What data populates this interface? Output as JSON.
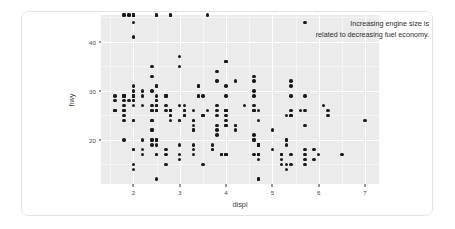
{
  "chart_data": {
    "type": "scatter",
    "title": "",
    "subtitle": "",
    "xlabel": "displ",
    "ylabel": "hwy",
    "xlim": [
      1.3,
      7.3
    ],
    "ylim": [
      11,
      45.5
    ],
    "xticks": [
      2,
      3,
      4,
      5,
      6,
      7
    ],
    "yticks": [
      20,
      30,
      40
    ],
    "grid": true,
    "legend": "none",
    "annotations": [
      {
        "name": "trend-note",
        "lines": [
          "Increasing engine size is",
          "related to decreasing fuel economy."
        ],
        "text": "Increasing engine size is related to decreasing fuel economy.",
        "align": "right",
        "x": 7.3,
        "y": 45
      }
    ],
    "point_color": "#1a1a1a",
    "panel_color": "#ebebeb",
    "grid_color": "#ffffff",
    "n_points": 234,
    "x": [
      1.8,
      1.8,
      2.0,
      2.0,
      2.8,
      2.8,
      3.1,
      1.8,
      1.8,
      2.0,
      2.0,
      2.8,
      2.8,
      3.1,
      3.1,
      2.8,
      3.1,
      4.2,
      5.3,
      5.3,
      5.3,
      5.7,
      6.0,
      5.7,
      5.7,
      6.2,
      6.2,
      7.0,
      5.3,
      5.3,
      5.7,
      6.5,
      2.4,
      2.4,
      3.1,
      3.5,
      3.6,
      2.4,
      3.0,
      3.3,
      3.3,
      3.3,
      3.3,
      3.3,
      3.8,
      3.8,
      3.8,
      4.0,
      3.7,
      3.7,
      3.9,
      3.9,
      4.7,
      4.7,
      4.7,
      5.2,
      5.2,
      3.9,
      4.7,
      4.7,
      4.7,
      5.2,
      5.7,
      5.9,
      4.7,
      4.7,
      4.7,
      4.7,
      4.7,
      4.7,
      5.2,
      5.2,
      5.7,
      5.9,
      4.6,
      5.4,
      5.4,
      4.0,
      4.0,
      4.0,
      4.0,
      4.6,
      5.0,
      4.2,
      4.2,
      4.6,
      4.6,
      4.6,
      5.4,
      5.4,
      3.8,
      3.8,
      4.0,
      4.0,
      4.6,
      4.6,
      4.6,
      4.6,
      5.4,
      1.6,
      1.6,
      1.6,
      1.6,
      1.6,
      1.8,
      1.8,
      1.8,
      2.0,
      2.4,
      2.4,
      2.4,
      2.4,
      2.5,
      2.5,
      3.3,
      2.0,
      2.0,
      2.0,
      2.0,
      2.7,
      2.7,
      2.7,
      3.0,
      3.7,
      4.0,
      4.7,
      4.7,
      4.7,
      5.7,
      6.1,
      4.0,
      4.2,
      4.4,
      4.6,
      5.4,
      5.4,
      5.4,
      4.0,
      4.0,
      4.6,
      5.0,
      2.4,
      2.4,
      2.5,
      2.5,
      3.5,
      3.5,
      3.0,
      3.0,
      3.5,
      3.3,
      3.3,
      4.0,
      5.6,
      3.1,
      3.8,
      3.8,
      3.8,
      5.3,
      2.5,
      2.5,
      2.5,
      2.5,
      2.5,
      2.5,
      2.2,
      2.2,
      2.5,
      2.5,
      2.5,
      2.5,
      2.5,
      2.5,
      2.7,
      2.7,
      3.4,
      3.4,
      4.0,
      4.7,
      2.2,
      2.2,
      2.4,
      2.4,
      3.0,
      3.0,
      3.5,
      2.2,
      2.2,
      2.4,
      2.4,
      3.0,
      3.0,
      3.3,
      1.8,
      1.8,
      1.8,
      1.8,
      1.8,
      4.7,
      5.7,
      2.7,
      2.7,
      2.7,
      3.4,
      3.4,
      4.0,
      4.0,
      2.0,
      2.0,
      2.0,
      2.0,
      2.8,
      1.9,
      2.0,
      2.0,
      2.0,
      2.0,
      2.5,
      2.5,
      2.8,
      2.8,
      1.9,
      1.9,
      2.0,
      2.0,
      2.5,
      2.5,
      1.8,
      1.8,
      2.0,
      2.0,
      2.8,
      2.8,
      3.6
    ],
    "y": [
      29,
      29,
      31,
      30,
      26,
      26,
      27,
      26,
      25,
      28,
      27,
      25,
      25,
      25,
      25,
      24,
      25,
      23,
      20,
      15,
      20,
      17,
      17,
      26,
      23,
      26,
      25,
      24,
      19,
      14,
      15,
      17,
      27,
      30,
      26,
      29,
      26,
      24,
      24,
      22,
      22,
      24,
      24,
      17,
      22,
      21,
      23,
      23,
      19,
      18,
      17,
      17,
      19,
      19,
      12,
      17,
      15,
      17,
      17,
      12,
      17,
      16,
      18,
      18,
      16,
      17,
      17,
      19,
      19,
      17,
      17,
      17,
      16,
      16,
      17,
      15,
      17,
      26,
      25,
      26,
      24,
      21,
      22,
      23,
      22,
      20,
      33,
      32,
      32,
      29,
      32,
      34,
      36,
      36,
      29,
      26,
      27,
      30,
      31,
      26,
      26,
      28,
      26,
      29,
      28,
      27,
      24,
      24,
      24,
      22,
      19,
      20,
      17,
      12,
      19,
      18,
      14,
      15,
      18,
      18,
      15,
      17,
      16,
      18,
      17,
      19,
      19,
      17,
      29,
      27,
      31,
      32,
      27,
      26,
      26,
      25,
      25,
      17,
      17,
      20,
      18,
      26,
      26,
      27,
      28,
      25,
      25,
      24,
      27,
      25,
      26,
      23,
      26,
      26,
      26,
      26,
      25,
      27,
      25,
      27,
      20,
      20,
      19,
      17,
      20,
      17,
      29,
      27,
      31,
      31,
      26,
      26,
      28,
      27,
      29,
      31,
      31,
      26,
      26,
      27,
      30,
      33,
      35,
      37,
      35,
      15,
      18,
      20,
      20,
      22,
      17,
      19,
      18,
      20,
      29,
      26,
      29,
      29,
      24,
      44,
      29,
      26,
      29,
      29,
      29,
      29,
      23,
      24,
      44,
      41,
      29,
      26,
      28,
      29,
      29,
      29,
      28,
      29,
      26,
      26,
      26
    ],
    "points": "234 observations of engine displacement (litres) vs highway miles per gallon"
  }
}
